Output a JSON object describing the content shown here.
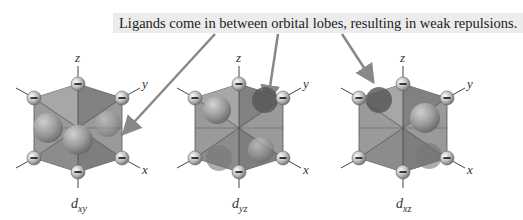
{
  "caption": "Ligands come in between orbital lobes, resulting in weak repulsions.",
  "axes": {
    "x": "x",
    "y": "y",
    "z": "z"
  },
  "orbitals": [
    {
      "name": "d",
      "sub": "xy"
    },
    {
      "name": "d",
      "sub": "yz"
    },
    {
      "name": "d",
      "sub": "xz"
    }
  ],
  "ligand_charge": "−",
  "colors": {
    "arrow": "#888888",
    "caption_bg": "#ececec",
    "octahedron": "#8a8a8a",
    "lobe": "#a0a0a0"
  }
}
